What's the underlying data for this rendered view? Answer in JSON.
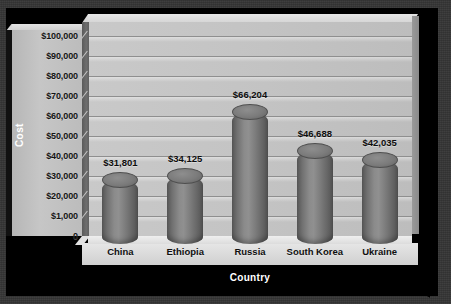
{
  "chart_data": {
    "type": "bar",
    "title": "",
    "xlabel": "Country",
    "ylabel": "Cost",
    "categories": [
      "China",
      "Ethiopia",
      "Russia",
      "South Korea",
      "Ukraine"
    ],
    "values": [
      31801,
      34125,
      66204,
      46688,
      42035
    ],
    "value_labels": [
      "$31,801",
      "$34,125",
      "$66,204",
      "$46,688",
      "$42,035"
    ],
    "ytick_labels": [
      "$100,000",
      "$90,000",
      "$80,000",
      "$70,000",
      "$60,000",
      "$50,000",
      "$40,000",
      "$30,000",
      "$20,000",
      "$1,000",
      "0"
    ],
    "ytick_values": [
      100000,
      90000,
      80000,
      70000,
      60000,
      50000,
      40000,
      30000,
      20000,
      10000,
      0
    ],
    "ylim": [
      0,
      100000
    ],
    "grid": true,
    "legend": false,
    "style": "3d-cylinder",
    "colors": {
      "background": "#343434",
      "plate": "#000000",
      "wall": "#c3c3c3",
      "floor": "#e0e0e0",
      "bar": "#7a7a7a",
      "bar_edge": "#4e4e4e",
      "gridline": "#8f8f8f",
      "axis_title_text": "#ffffff",
      "label_text": "#101010"
    }
  }
}
